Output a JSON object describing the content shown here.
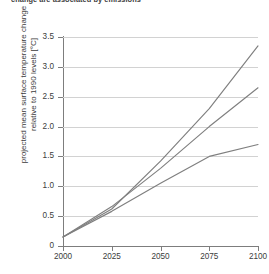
{
  "chart_data": {
    "type": "line",
    "title": "change are associated by emissions",
    "xlabel": "",
    "ylabel": "projected mean surface temperature change relative to 1990 levels [°C]",
    "xlim": [
      2000,
      2100
    ],
    "ylim": [
      0,
      3.5
    ],
    "grid": true,
    "legend": "none",
    "x_ticks": [
      "2000",
      "2025",
      "2050",
      "2075",
      "2100"
    ],
    "x_tick_values": [
      2000,
      2025,
      2050,
      2075,
      2100
    ],
    "y_ticks": [
      "0",
      "0.5",
      "1.0",
      "1.5",
      "2.0",
      "2.5",
      "3.0",
      "3.5"
    ],
    "y_tick_values": [
      0,
      0.5,
      1.0,
      1.5,
      2.0,
      2.5,
      3.0,
      3.5
    ],
    "line_color": "#7f7f7f",
    "x": [
      2000,
      2025,
      2050,
      2075,
      2100
    ],
    "series": [
      {
        "name": "high emissions scenario",
        "values": [
          0.15,
          0.62,
          1.42,
          2.3,
          3.35
        ]
      },
      {
        "name": "medium emissions scenario",
        "values": [
          0.15,
          0.66,
          1.3,
          2.0,
          2.65
        ]
      },
      {
        "name": "low emissions scenario",
        "values": [
          0.15,
          0.58,
          1.05,
          1.5,
          1.7
        ]
      }
    ]
  },
  "axes": {
    "y_title_line1": "projected mean surface temperature change",
    "y_title_line2": "relative to 1990 levels [°C]"
  }
}
